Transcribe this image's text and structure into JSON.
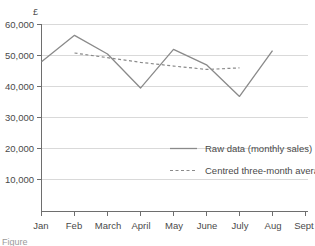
{
  "chart_data": {
    "type": "line",
    "title": "",
    "subtitle": "",
    "xlabel": "",
    "ylabel": "£",
    "unit_symbol": "£",
    "categories": [
      "Jan",
      "Feb",
      "March",
      "April",
      "May",
      "June",
      "July",
      "Aug",
      "Sept"
    ],
    "ytick_labels": [
      "10,000",
      "20,000",
      "30,000",
      "40,000",
      "50,000",
      "60,000"
    ],
    "ytick_values": [
      10000,
      20000,
      30000,
      40000,
      50000,
      60000
    ],
    "ylim": [
      0,
      60000
    ],
    "grid": true,
    "legend_position": "inside-right",
    "series": [
      {
        "name": "Raw data (monthly sales)",
        "style": "solid",
        "color": "#8a8a8a",
        "x": [
          "Jan",
          "Feb",
          "March",
          "April",
          "May",
          "June",
          "July",
          "Aug"
        ],
        "values": [
          48000,
          56500,
          50500,
          39500,
          52000,
          47000,
          36800,
          51600
        ]
      },
      {
        "name": "Centred three-month average",
        "style": "dashed",
        "color": "#8a8a8a",
        "x": [
          "Feb",
          "March",
          "April",
          "May",
          "June",
          "July"
        ],
        "values": [
          50800,
          49300,
          47800,
          46600,
          45500,
          46000
        ]
      }
    ],
    "legend": [
      {
        "label": "Raw data (monthly sales)",
        "style": "solid"
      },
      {
        "label": "Centred three-month average",
        "style": "dashed"
      }
    ]
  },
  "caption": {
    "partial_text": "Figure"
  }
}
